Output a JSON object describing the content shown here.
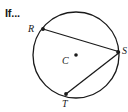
{
  "figure": {
    "prompt": "If...",
    "stroke_color": "#1a1a1a",
    "background_color": "#ffffff",
    "circle": {
      "center_x": 76,
      "center_y": 55,
      "radius": 43,
      "center_marker": "center-dot"
    },
    "labels": {
      "center": "C",
      "vertex_upper_left": "R",
      "vertex_bottom": "T",
      "vertex_right": "S"
    },
    "points": [
      {
        "name": "R",
        "x": 43,
        "y": 29
      },
      {
        "name": "S",
        "x": 118,
        "y": 52
      },
      {
        "name": "T",
        "x": 66,
        "y": 94
      },
      {
        "name": "C",
        "x": 76,
        "y": 55
      }
    ],
    "chords": [
      {
        "name": "chord-RS",
        "from": "R",
        "to": "S"
      },
      {
        "name": "chord-ST",
        "from": "S",
        "to": "T"
      }
    ]
  }
}
